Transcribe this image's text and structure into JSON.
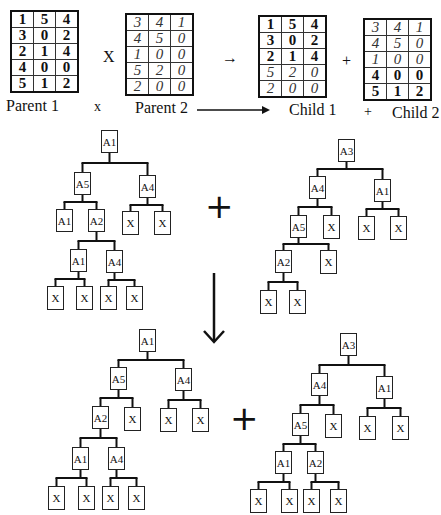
{
  "figure": {
    "top_row": {
      "parent1": {
        "label": "Parent 1",
        "rows": [
          [
            "1",
            "5",
            "4"
          ],
          [
            "3",
            "0",
            "2"
          ],
          [
            "2",
            "1",
            "4"
          ],
          [
            "4",
            "0",
            "0"
          ],
          [
            "5",
            "1",
            "2"
          ]
        ],
        "styles": [
          [
            "b",
            "b",
            "b"
          ],
          [
            "b",
            "b",
            "b"
          ],
          [
            "b",
            "b",
            "b"
          ],
          [
            "b",
            "b",
            "b"
          ],
          [
            "b",
            "b",
            "b"
          ]
        ]
      },
      "times_symbol": "X",
      "small_times_symbol": "x",
      "parent2": {
        "label": "Parent 2",
        "rows": [
          [
            "3",
            "4",
            "1"
          ],
          [
            "4",
            "5",
            "0"
          ],
          [
            "1",
            "0",
            "0"
          ],
          [
            "5",
            "2",
            "0"
          ],
          [
            "2",
            "0",
            "0"
          ]
        ],
        "styles": [
          [
            "i",
            "i",
            "i"
          ],
          [
            "i",
            "i",
            "i"
          ],
          [
            "i",
            "i",
            "i"
          ],
          [
            "i",
            "i",
            "i"
          ],
          [
            "i",
            "i",
            "i"
          ]
        ]
      },
      "arrow_symbol": "→",
      "child1": {
        "label": "Child 1",
        "rows": [
          [
            "1",
            "5",
            "4"
          ],
          [
            "3",
            "0",
            "2"
          ],
          [
            "2",
            "1",
            "4"
          ],
          [
            "5",
            "2",
            "0"
          ],
          [
            "2",
            "0",
            "0"
          ]
        ],
        "styles": [
          [
            "b",
            "b",
            "b"
          ],
          [
            "b",
            "b",
            "b"
          ],
          [
            "b",
            "b",
            "b"
          ],
          [
            "i",
            "i",
            "i"
          ],
          [
            "i",
            "i",
            "i"
          ]
        ]
      },
      "plus_symbol": "+",
      "child2": {
        "label": "Child 2",
        "rows": [
          [
            "3",
            "4",
            "1"
          ],
          [
            "4",
            "5",
            "0"
          ],
          [
            "1",
            "0",
            "0"
          ],
          [
            "4",
            "0",
            "0"
          ],
          [
            "5",
            "1",
            "2"
          ]
        ],
        "styles": [
          [
            "i",
            "i",
            "i"
          ],
          [
            "i",
            "i",
            "i"
          ],
          [
            "i",
            "i",
            "i"
          ],
          [
            "b",
            "b",
            "b"
          ],
          [
            "b",
            "b",
            "b"
          ]
        ]
      }
    },
    "big_plus": "+",
    "trees": {
      "parent_tree_1": {
        "nodes": [
          {
            "id": "r",
            "label": "A1",
            "x": 101,
            "y": 130
          },
          {
            "id": "a5",
            "label": "A5",
            "x": 74,
            "y": 172
          },
          {
            "id": "a4",
            "label": "A4",
            "x": 139,
            "y": 175
          },
          {
            "id": "a1b",
            "label": "A1",
            "x": 56,
            "y": 209
          },
          {
            "id": "a2",
            "label": "A2",
            "x": 88,
            "y": 209
          },
          {
            "id": "x1",
            "label": "X",
            "x": 122,
            "y": 211
          },
          {
            "id": "x2",
            "label": "X",
            "x": 154,
            "y": 211
          },
          {
            "id": "a1c",
            "label": "A1",
            "x": 70,
            "y": 249
          },
          {
            "id": "a4b",
            "label": "A4",
            "x": 106,
            "y": 250
          },
          {
            "id": "x3",
            "label": "X",
            "x": 47,
            "y": 286
          },
          {
            "id": "x4",
            "label": "X",
            "x": 76,
            "y": 286
          },
          {
            "id": "x5",
            "label": "X",
            "x": 100,
            "y": 286
          },
          {
            "id": "x6",
            "label": "X",
            "x": 126,
            "y": 286
          }
        ]
      },
      "parent_tree_2": {
        "nodes": [
          {
            "id": "r",
            "label": "A3",
            "x": 338,
            "y": 139
          },
          {
            "id": "a4",
            "label": "A4",
            "x": 309,
            "y": 176
          },
          {
            "id": "a1",
            "label": "A1",
            "x": 374,
            "y": 179
          },
          {
            "id": "a5",
            "label": "A5",
            "x": 290,
            "y": 215
          },
          {
            "id": "x1",
            "label": "X",
            "x": 323,
            "y": 215
          },
          {
            "id": "x2",
            "label": "X",
            "x": 358,
            "y": 216
          },
          {
            "id": "x3",
            "label": "X",
            "x": 390,
            "y": 216
          },
          {
            "id": "a2",
            "label": "A2",
            "x": 275,
            "y": 250
          },
          {
            "id": "x4",
            "label": "X",
            "x": 320,
            "y": 250
          },
          {
            "id": "x5",
            "label": "X",
            "x": 260,
            "y": 290
          },
          {
            "id": "x6",
            "label": "X",
            "x": 289,
            "y": 290
          }
        ]
      },
      "offspring_tree_1": {
        "nodes": [
          {
            "id": "r",
            "label": "A1",
            "x": 139,
            "y": 329
          },
          {
            "id": "a5",
            "label": "A5",
            "x": 110,
            "y": 367
          },
          {
            "id": "a4",
            "label": "A4",
            "x": 175,
            "y": 368
          },
          {
            "id": "a2",
            "label": "A2",
            "x": 92,
            "y": 406
          },
          {
            "id": "x1",
            "label": "X",
            "x": 124,
            "y": 407
          },
          {
            "id": "x2",
            "label": "X",
            "x": 160,
            "y": 408
          },
          {
            "id": "x3",
            "label": "X",
            "x": 192,
            "y": 408
          },
          {
            "id": "a1b",
            "label": "A1",
            "x": 72,
            "y": 447
          },
          {
            "id": "a4b",
            "label": "A4",
            "x": 108,
            "y": 447
          },
          {
            "id": "x4",
            "label": "X",
            "x": 48,
            "y": 486
          },
          {
            "id": "x5",
            "label": "X",
            "x": 78,
            "y": 486
          },
          {
            "id": "x6",
            "label": "X",
            "x": 102,
            "y": 486
          },
          {
            "id": "x7",
            "label": "X",
            "x": 128,
            "y": 486
          }
        ]
      },
      "offspring_tree_2": {
        "nodes": [
          {
            "id": "r",
            "label": "A3",
            "x": 340,
            "y": 333
          },
          {
            "id": "a4",
            "label": "A4",
            "x": 311,
            "y": 373
          },
          {
            "id": "a1",
            "label": "A1",
            "x": 376,
            "y": 376
          },
          {
            "id": "a5",
            "label": "A5",
            "x": 292,
            "y": 413
          },
          {
            "id": "x1",
            "label": "X",
            "x": 325,
            "y": 414
          },
          {
            "id": "x2",
            "label": "X",
            "x": 359,
            "y": 416
          },
          {
            "id": "x3",
            "label": "X",
            "x": 392,
            "y": 416
          },
          {
            "id": "a1b",
            "label": "A1",
            "x": 275,
            "y": 451
          },
          {
            "id": "a2",
            "label": "A2",
            "x": 307,
            "y": 451
          },
          {
            "id": "x4",
            "label": "X",
            "x": 250,
            "y": 489
          },
          {
            "id": "x5",
            "label": "X",
            "x": 281,
            "y": 489
          },
          {
            "id": "x6",
            "label": "X",
            "x": 303,
            "y": 489
          },
          {
            "id": "x7",
            "label": "X",
            "x": 330,
            "y": 489
          }
        ]
      }
    }
  }
}
